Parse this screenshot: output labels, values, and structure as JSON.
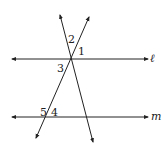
{
  "diagram": {
    "type": "parallel-lines-transversals",
    "colors": {
      "line": "#222222",
      "background": "#ffffff"
    },
    "lines": [
      {
        "id": "l",
        "label": "ℓ",
        "kind": "parallel",
        "x1": 12,
        "y1": 59,
        "x2": 148,
        "y2": 59
      },
      {
        "id": "m",
        "label": "m",
        "kind": "parallel",
        "x1": 12,
        "y1": 117,
        "x2": 148,
        "y2": 117
      },
      {
        "id": "t1",
        "label": "",
        "kind": "transversal",
        "x1": 60,
        "y1": 15,
        "x2": 93,
        "y2": 142
      },
      {
        "id": "t2",
        "label": "",
        "kind": "transversal",
        "x1": 89,
        "y1": 17,
        "x2": 36,
        "y2": 138
      }
    ],
    "angle_labels": [
      {
        "text": "2",
        "x": 68,
        "y": 43
      },
      {
        "text": "1",
        "x": 78,
        "y": 55
      },
      {
        "text": "3",
        "x": 57,
        "y": 72
      },
      {
        "text": "5",
        "x": 40,
        "y": 116
      },
      {
        "text": "4",
        "x": 51,
        "y": 116
      }
    ],
    "line_labels": {
      "l": {
        "text": "ℓ",
        "x": 150,
        "y": 62
      },
      "m": {
        "text": "m",
        "x": 151,
        "y": 120
      }
    }
  }
}
